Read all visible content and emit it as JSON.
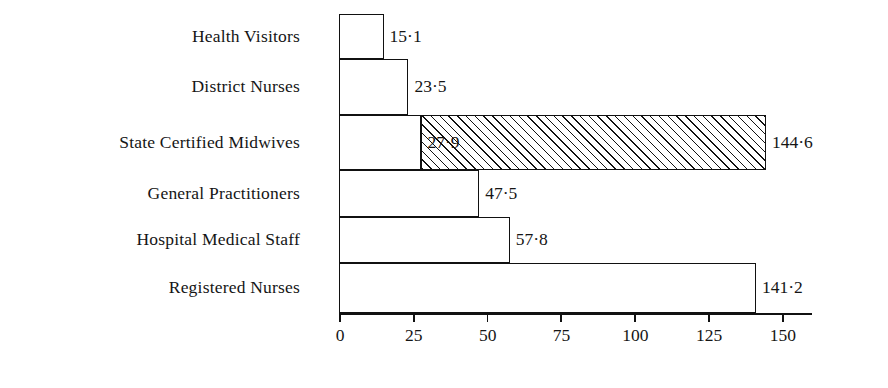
{
  "chart_data": {
    "type": "bar",
    "orientation": "horizontal",
    "title": "",
    "subtitle": "",
    "xlabel": "",
    "ylabel": "",
    "xlim": [
      0,
      155
    ],
    "grid": false,
    "legend": null,
    "xticks": [
      0,
      25,
      50,
      75,
      100,
      125,
      150
    ],
    "xtick_labels": [
      "0",
      "25",
      "50",
      "75",
      "100",
      "125",
      "150"
    ],
    "decimal_separator": "·",
    "categories": [
      "Health Visitors",
      "District Nurses",
      "State Certified Midwives",
      "General  Practitioners",
      "Hospital  Medical  Staff",
      "Registered Nurses"
    ],
    "values": [
      15.1,
      23.5,
      144.6,
      47.5,
      57.8,
      141.2
    ],
    "value_labels": [
      "15·1",
      "23·5",
      "144·6",
      "47·5",
      "57·8",
      "141·2"
    ],
    "bars": [
      {
        "category": "Health Visitors",
        "value": 15.1,
        "label": "15·1",
        "label_position": "outside-right",
        "segments": [
          {
            "from": 0,
            "to": 15.1,
            "fill": "white",
            "label": null
          }
        ]
      },
      {
        "category": "District Nurses",
        "value": 23.5,
        "label": "23·5",
        "label_position": "outside-right",
        "segments": [
          {
            "from": 0,
            "to": 23.5,
            "fill": "white",
            "label": null
          }
        ]
      },
      {
        "category": "State Certified Midwives",
        "value": 144.6,
        "label": "144·6",
        "label_position": "outside-right",
        "segments": [
          {
            "from": 0,
            "to": 27.9,
            "fill": "white",
            "label": null
          },
          {
            "from": 27.9,
            "to": 144.6,
            "fill": "hatched",
            "label": "27·9"
          }
        ]
      },
      {
        "category": "General  Practitioners",
        "value": 47.5,
        "label": "47·5",
        "label_position": "outside-right",
        "segments": [
          {
            "from": 0,
            "to": 47.5,
            "fill": "white",
            "label": null
          }
        ]
      },
      {
        "category": "Hospital  Medical  Staff",
        "value": 57.8,
        "label": "57·8",
        "label_position": "outside-right",
        "segments": [
          {
            "from": 0,
            "to": 57.8,
            "fill": "white",
            "label": null
          }
        ]
      },
      {
        "category": "Registered Nurses",
        "value": 141.2,
        "label": "141·2",
        "label_position": "outside-right",
        "segments": [
          {
            "from": 0,
            "to": 141.2,
            "fill": "white",
            "label": null
          }
        ]
      }
    ],
    "colors": {
      "ink": "#111111",
      "background": "#ffffff",
      "hatch": "#111111"
    }
  },
  "layout": {
    "axis_origin_x": 339,
    "pixels_per_unit": 2.953,
    "band_edges": [
      14,
      59,
      115,
      170,
      217,
      263,
      313
    ],
    "label_right_edge": 300,
    "tick_length": 9,
    "axis_end_x": 812
  }
}
